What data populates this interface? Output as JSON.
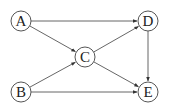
{
  "diagram": {
    "type": "directed-graph",
    "nodes": [
      {
        "id": "A",
        "label": "A",
        "x": 21,
        "y": 21
      },
      {
        "id": "B",
        "label": "B",
        "x": 21,
        "y": 92
      },
      {
        "id": "C",
        "label": "C",
        "x": 85,
        "y": 57
      },
      {
        "id": "D",
        "label": "D",
        "x": 148,
        "y": 21
      },
      {
        "id": "E",
        "label": "E",
        "x": 148,
        "y": 92
      }
    ],
    "edges": [
      {
        "from": "A",
        "to": "D"
      },
      {
        "from": "A",
        "to": "C"
      },
      {
        "from": "B",
        "to": "C"
      },
      {
        "from": "B",
        "to": "E"
      },
      {
        "from": "C",
        "to": "D"
      },
      {
        "from": "C",
        "to": "E"
      },
      {
        "from": "D",
        "to": "E"
      }
    ],
    "colors": {
      "stroke": "#555555",
      "node_fill": "#ffffff",
      "text": "#222222"
    }
  }
}
